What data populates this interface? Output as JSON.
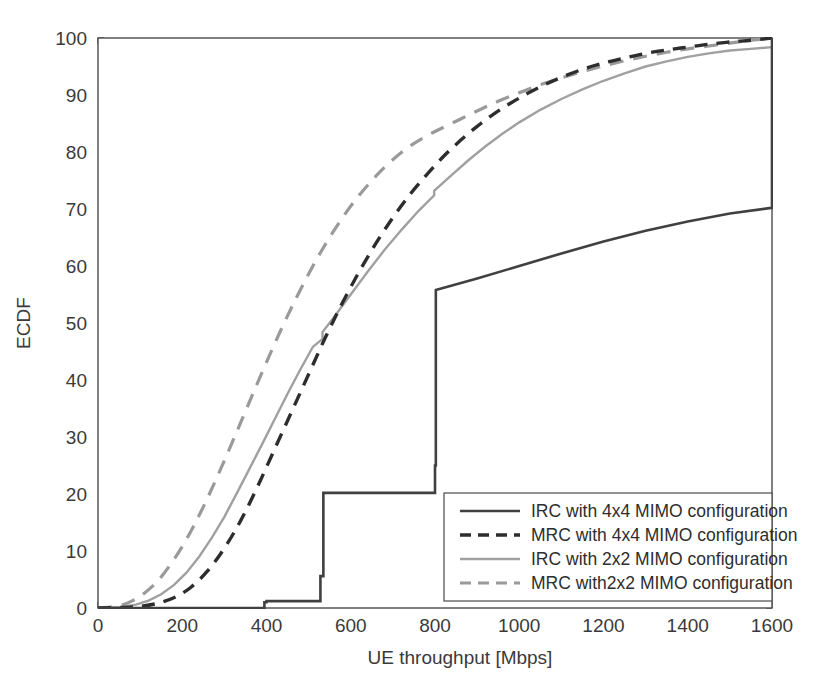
{
  "chart_data": {
    "type": "line",
    "title": "",
    "xlabel": "UE throughput [Mbps]",
    "ylabel": "ECDF",
    "xlim": [
      0,
      1600
    ],
    "ylim": [
      0,
      100
    ],
    "xticks": [
      0,
      200,
      400,
      600,
      800,
      1000,
      1200,
      1400,
      1600
    ],
    "yticks": [
      0,
      10,
      20,
      30,
      40,
      50,
      60,
      70,
      80,
      90,
      100
    ],
    "xtick_labels": [
      "0",
      "200",
      "400",
      "600",
      "800",
      "1000",
      "1200",
      "1400",
      "1600"
    ],
    "ytick_labels": [
      "0",
      "10",
      "20",
      "30",
      "40",
      "50",
      "60",
      "70",
      "80",
      "90",
      "100"
    ],
    "grid": true,
    "grid_style": "dotted",
    "legend_position": "lower right",
    "series": [
      {
        "name": "IRC with 4x4 MIMO configuration",
        "style": "solid",
        "color": "#404040",
        "width": 2.6,
        "shape": "step",
        "points": [
          [
            0,
            0
          ],
          [
            395,
            0
          ],
          [
            395,
            1.0
          ],
          [
            400,
            1.0
          ],
          [
            400,
            1.2
          ],
          [
            528,
            1.2
          ],
          [
            528,
            5.6
          ],
          [
            535,
            5.6
          ],
          [
            535,
            20.2
          ],
          [
            800,
            20.2
          ],
          [
            800,
            25.0
          ],
          [
            802,
            25.0
          ],
          [
            802,
            55.8
          ],
          [
            900,
            57.8
          ],
          [
            1000,
            60.0
          ],
          [
            1100,
            62.2
          ],
          [
            1200,
            64.3
          ],
          [
            1300,
            66.2
          ],
          [
            1400,
            67.8
          ],
          [
            1500,
            69.2
          ],
          [
            1598,
            70.2
          ],
          [
            1600,
            70.2
          ],
          [
            1600,
            100
          ]
        ]
      },
      {
        "name": "MRC with 4x4 MIMO configuration",
        "style": "dashed",
        "color": "#2d2d2d",
        "width": 3.4,
        "dash": "13,9",
        "shape": "smooth",
        "points": [
          [
            0,
            0
          ],
          [
            60,
            0.1
          ],
          [
            100,
            0.3
          ],
          [
            140,
            0.8
          ],
          [
            180,
            1.8
          ],
          [
            220,
            3.6
          ],
          [
            260,
            6.5
          ],
          [
            300,
            10.5
          ],
          [
            340,
            15.5
          ],
          [
            380,
            21.5
          ],
          [
            420,
            28.0
          ],
          [
            460,
            34.5
          ],
          [
            500,
            41.0
          ],
          [
            540,
            47.5
          ],
          [
            580,
            53.5
          ],
          [
            620,
            59.0
          ],
          [
            660,
            64.0
          ],
          [
            700,
            68.5
          ],
          [
            740,
            72.5
          ],
          [
            780,
            76.0
          ],
          [
            820,
            79.2
          ],
          [
            860,
            82.0
          ],
          [
            900,
            84.5
          ],
          [
            940,
            86.7
          ],
          [
            980,
            88.6
          ],
          [
            1020,
            90.3
          ],
          [
            1060,
            91.8
          ],
          [
            1100,
            93.1
          ],
          [
            1150,
            94.5
          ],
          [
            1200,
            95.6
          ],
          [
            1250,
            96.5
          ],
          [
            1300,
            97.3
          ],
          [
            1350,
            97.9
          ],
          [
            1400,
            98.4
          ],
          [
            1450,
            98.9
          ],
          [
            1500,
            99.3
          ],
          [
            1550,
            99.6
          ],
          [
            1600,
            100
          ]
        ]
      },
      {
        "name": "IRC with 2x2 MIMO configuration",
        "style": "solid",
        "color": "#a0a0a0",
        "width": 2.4,
        "shape": "piecewise",
        "points": [
          [
            0,
            0
          ],
          [
            55,
            0.2
          ],
          [
            90,
            0.6
          ],
          [
            120,
            1.3
          ],
          [
            150,
            2.4
          ],
          [
            180,
            4.0
          ],
          [
            210,
            6.2
          ],
          [
            240,
            9.0
          ],
          [
            270,
            12.3
          ],
          [
            300,
            16.0
          ],
          [
            330,
            20.2
          ],
          [
            360,
            24.5
          ],
          [
            390,
            28.8
          ],
          [
            420,
            33.2
          ],
          [
            450,
            37.6
          ],
          [
            480,
            41.8
          ],
          [
            510,
            45.8
          ],
          [
            533,
            47.2
          ],
          [
            533,
            48.4
          ],
          [
            560,
            51.0
          ],
          [
            600,
            55.0
          ],
          [
            640,
            59.0
          ],
          [
            680,
            62.8
          ],
          [
            720,
            66.3
          ],
          [
            760,
            69.6
          ],
          [
            798,
            72.4
          ],
          [
            798,
            73.2
          ],
          [
            840,
            76.0
          ],
          [
            880,
            78.6
          ],
          [
            920,
            81.0
          ],
          [
            960,
            83.2
          ],
          [
            1000,
            85.2
          ],
          [
            1050,
            87.4
          ],
          [
            1100,
            89.3
          ],
          [
            1150,
            91.0
          ],
          [
            1200,
            92.5
          ],
          [
            1250,
            93.8
          ],
          [
            1300,
            95.0
          ],
          [
            1350,
            95.9
          ],
          [
            1400,
            96.7
          ],
          [
            1450,
            97.3
          ],
          [
            1500,
            97.8
          ],
          [
            1550,
            98.1
          ],
          [
            1600,
            98.4
          ]
        ]
      },
      {
        "name": "MRC with2x2 MIMO configuration",
        "style": "dashed",
        "color": "#9a9a9a",
        "width": 3.2,
        "dash": "14,10",
        "shape": "smooth",
        "points": [
          [
            0,
            0
          ],
          [
            50,
            0.4
          ],
          [
            80,
            1.2
          ],
          [
            110,
            2.6
          ],
          [
            140,
            4.6
          ],
          [
            170,
            7.4
          ],
          [
            200,
            10.8
          ],
          [
            230,
            14.8
          ],
          [
            260,
            19.3
          ],
          [
            290,
            24.2
          ],
          [
            320,
            29.3
          ],
          [
            350,
            34.5
          ],
          [
            380,
            39.7
          ],
          [
            410,
            44.8
          ],
          [
            440,
            49.7
          ],
          [
            470,
            54.3
          ],
          [
            500,
            58.6
          ],
          [
            530,
            62.6
          ],
          [
            560,
            66.2
          ],
          [
            590,
            69.5
          ],
          [
            620,
            72.4
          ],
          [
            650,
            75.0
          ],
          [
            680,
            77.3
          ],
          [
            710,
            79.3
          ],
          [
            740,
            81.0
          ],
          [
            770,
            82.4
          ],
          [
            800,
            83.6
          ],
          [
            850,
            85.4
          ],
          [
            900,
            87.2
          ],
          [
            950,
            88.9
          ],
          [
            1000,
            90.4
          ],
          [
            1050,
            91.8
          ],
          [
            1100,
            93.0
          ],
          [
            1150,
            94.1
          ],
          [
            1200,
            95.1
          ],
          [
            1250,
            96.0
          ],
          [
            1300,
            96.8
          ],
          [
            1350,
            97.5
          ],
          [
            1400,
            98.1
          ],
          [
            1450,
            98.6
          ],
          [
            1500,
            99.1
          ],
          [
            1550,
            99.6
          ],
          [
            1600,
            100
          ]
        ]
      }
    ]
  },
  "legend": {
    "items": [
      {
        "label": "IRC with 4x4 MIMO configuration"
      },
      {
        "label": "MRC with 4x4 MIMO configuration"
      },
      {
        "label": "IRC with 2x2 MIMO configuration"
      },
      {
        "label": "MRC with2x2 MIMO configuration"
      }
    ]
  },
  "colors": {
    "irc_4x4": "#404040",
    "mrc_4x4": "#2d2d2d",
    "irc_2x2": "#a0a0a0",
    "mrc_2x2": "#9a9a9a",
    "axis": "#4a4a4a",
    "grid": "#b4b4b4",
    "background": "#ffffff"
  }
}
